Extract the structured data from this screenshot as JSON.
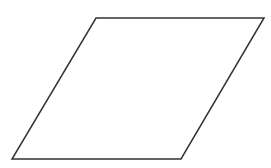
{
  "diagram": {
    "type": "geometric-shape",
    "shape": "parallelogram",
    "canvas": {
      "width": 271,
      "height": 168,
      "background": "#ffffff"
    },
    "stroke": {
      "color": "#333333",
      "width": 1.5
    },
    "fill": "none",
    "vertices": [
      {
        "name": "top-left",
        "x": 96,
        "y": 18
      },
      {
        "name": "top-right",
        "x": 264,
        "y": 18
      },
      {
        "name": "bottom-right",
        "x": 181,
        "y": 159
      },
      {
        "name": "bottom-left",
        "x": 12,
        "y": 159
      }
    ]
  }
}
